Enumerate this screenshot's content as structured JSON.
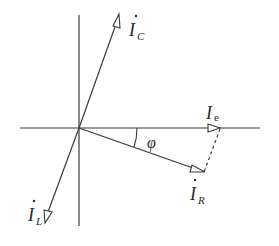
{
  "diagram": {
    "colors": {
      "line": "#3a3a3a",
      "background": "#ffffff"
    },
    "axes": {
      "origin": [
        79,
        128
      ],
      "horizontal": {
        "x1": 20,
        "x2": 260,
        "y": 128
      },
      "vertical": {
        "x": 79,
        "y1": 15,
        "y2": 226
      }
    },
    "phasors": [
      {
        "id": "IC",
        "label": "I",
        "subscript": "C",
        "dot": true,
        "tip": [
          119,
          14
        ]
      },
      {
        "id": "IL",
        "label": "I",
        "subscript": "L",
        "dot": true,
        "tip": [
          45,
          223
        ]
      },
      {
        "id": "IR",
        "label": "I",
        "subscript": "R",
        "dot": true,
        "tip": [
          205,
          172
        ]
      },
      {
        "id": "Ie",
        "label": "I",
        "subscript": "e",
        "dot": false,
        "tip": [
          220,
          128
        ]
      }
    ],
    "dashed_line": {
      "from": [
        220,
        128
      ],
      "to": [
        204,
        172
      ]
    },
    "angle": {
      "label": "φ",
      "between": [
        "Ie",
        "IR"
      ]
    }
  }
}
